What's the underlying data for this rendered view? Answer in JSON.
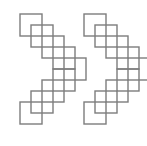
{
  "canvas": {
    "width": 147,
    "height": 146,
    "background_color": "#ffffff",
    "description": "Two identical zigzag chains of outlined squares"
  },
  "style": {
    "stroke_color": "#7d7d7d",
    "stroke_width": 1.4,
    "fill": "none"
  },
  "chart_data": {
    "type": "scatter",
    "title": "",
    "subtitle": "",
    "xlabel": "",
    "ylabel": "",
    "xlim": [
      0,
      147
    ],
    "ylim": [
      0,
      146
    ],
    "grid": false,
    "legend": null,
    "annotations": [],
    "square_size": 22,
    "step": 11,
    "series": [
      {
        "name": "left-zigzag-chain",
        "squares": [
          {
            "x": 20,
            "y": 14
          },
          {
            "x": 31,
            "y": 25
          },
          {
            "x": 42,
            "y": 36
          },
          {
            "x": 53,
            "y": 47
          },
          {
            "x": 64,
            "y": 58
          },
          {
            "x": 53,
            "y": 69
          },
          {
            "x": 42,
            "y": 80
          },
          {
            "x": 31,
            "y": 91
          },
          {
            "x": 20,
            "y": 102
          }
        ]
      },
      {
        "name": "right-zigzag-chain",
        "squares": [
          {
            "x": 84,
            "y": 14
          },
          {
            "x": 95,
            "y": 25
          },
          {
            "x": 106,
            "y": 36
          },
          {
            "x": 117,
            "y": 47
          },
          {
            "x": 128,
            "y": 58
          },
          {
            "x": 117,
            "y": 69
          },
          {
            "x": 106,
            "y": 80
          },
          {
            "x": 95,
            "y": 91
          },
          {
            "x": 84,
            "y": 102
          }
        ]
      }
    ]
  }
}
